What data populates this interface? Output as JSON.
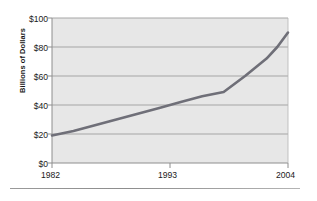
{
  "chart_data": {
    "type": "line",
    "title": "",
    "xlabel": "",
    "ylabel": "Billions of Dollars",
    "xlim": [
      1982,
      2004
    ],
    "ylim": [
      0,
      100
    ],
    "grid": true,
    "legend": "none",
    "x_tick_labels": [
      "1982",
      "1993",
      "2004"
    ],
    "x_tick_values": [
      1982,
      1993,
      2004
    ],
    "y_tick_labels": [
      "$0",
      "$20",
      "$40",
      "$60",
      "$80",
      "$100"
    ],
    "y_tick_values": [
      0,
      20,
      40,
      60,
      80,
      100
    ],
    "series": [
      {
        "name": "Billions of Dollars",
        "color": "#6f6f78",
        "x": [
          1982,
          1984,
          1986,
          1988,
          1990,
          1992,
          1994,
          1996,
          1998,
          2000,
          2002,
          2003,
          2004
        ],
        "values": [
          19,
          22,
          26,
          30,
          34,
          38,
          42,
          46,
          49,
          60,
          72,
          80,
          90
        ]
      }
    ]
  },
  "axes": {
    "y_title": "Billions of Dollars",
    "y_labels": [
      "$100",
      "$80",
      "$60",
      "$40",
      "$20",
      "$0"
    ],
    "x_labels": [
      "1982",
      "1993",
      "2004"
    ]
  },
  "style": {
    "plot_background": "#e7e7e7",
    "gridline_color": "#9d9d9d",
    "axis_color": "#8e8e8e",
    "line_color": "#6f6f78",
    "rule_color": "#9a9a9a"
  }
}
